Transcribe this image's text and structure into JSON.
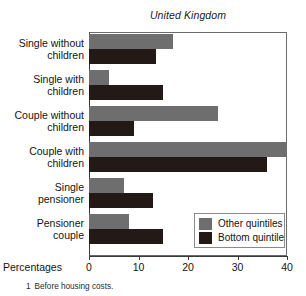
{
  "chart_data": {
    "type": "bar",
    "orientation": "horizontal",
    "title": "United Kingdom",
    "xlabel": "Percentages",
    "ylabel": "",
    "xlim": [
      0,
      40
    ],
    "xticks": [
      0,
      10,
      20,
      30,
      40
    ],
    "xtick_labels": [
      "0",
      "10",
      "20",
      "30",
      "40"
    ],
    "grid": false,
    "legend_position": "bottom-right",
    "categories": [
      "Single without children",
      "Single with children",
      "Couple without children",
      "Couple with children",
      "Single pensioner",
      "Pensioner couple"
    ],
    "series": [
      {
        "name": "Other quintiles",
        "color": "#6e6e6e",
        "values": [
          17,
          4,
          26,
          40,
          7,
          8
        ]
      },
      {
        "name": "Bottom quintile",
        "color": "#231a17",
        "values": [
          13.5,
          15,
          9,
          36,
          13,
          15
        ]
      }
    ]
  },
  "title": "United Kingdom",
  "axis": {
    "percentages_label": "Percentages",
    "tick_labels": [
      "0",
      "10",
      "20",
      "30",
      "40"
    ]
  },
  "categories": [
    {
      "line1": "Single without",
      "line2": "children"
    },
    {
      "line1": "Single with",
      "line2": "children"
    },
    {
      "line1": "Couple without",
      "line2": "children"
    },
    {
      "line1": "Couple with",
      "line2": "children"
    },
    {
      "line1": "Single",
      "line2": "pensioner"
    },
    {
      "line1": "Pensioner",
      "line2": "couple"
    }
  ],
  "legend": {
    "items": [
      {
        "label": "Other quintiles",
        "color": "#6e6e6e"
      },
      {
        "label": "Bottom quintile",
        "color": "#231a17"
      }
    ]
  },
  "footnote": {
    "marker": "1",
    "text": "Before housing costs."
  }
}
